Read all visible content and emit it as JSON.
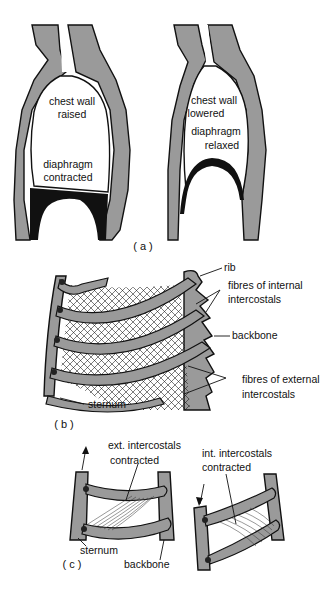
{
  "figure": {
    "panel_a": {
      "caption": "( a )",
      "left": {
        "label_line1": "chest wall",
        "label_line2": "raised",
        "label_line3": "diaphragm",
        "label_line4": "contracted"
      },
      "right": {
        "label_line1": "chest wall",
        "label_line2": "lowered",
        "label_line3": "diaphragm",
        "label_line4": "relaxed"
      }
    },
    "panel_b": {
      "caption": "( b )",
      "labels": {
        "rib": "rib",
        "internal_line1": "fibres of internal",
        "internal_line2": "intercostals",
        "backbone": "backbone",
        "external_line1": "fibres of external",
        "external_line2": "intercostals",
        "sternum": "sternum"
      }
    },
    "panel_c": {
      "caption": "( c )",
      "left": {
        "label_line1": "ext. intercostals",
        "label_line2": "contracted",
        "sternum": "sternum",
        "backbone": "backbone",
        "arrow_direction": "up"
      },
      "right": {
        "label_line1": "int. intercostals",
        "label_line2": "contracted",
        "arrow_direction": "down"
      }
    }
  }
}
